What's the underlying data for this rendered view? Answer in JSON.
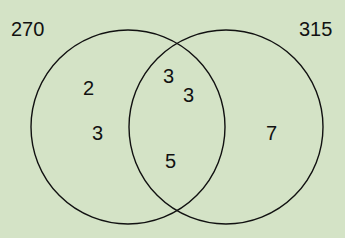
{
  "diagram": {
    "type": "venn",
    "background": "#d4e3c6",
    "sets": [
      {
        "label": "270",
        "cx": 128,
        "cy": 127,
        "r": 97
      },
      {
        "label": "315",
        "cx": 226,
        "cy": 127,
        "r": 97
      }
    ],
    "regions": {
      "left_only": [
        "2",
        "3"
      ],
      "intersection": [
        "3",
        "3",
        "5"
      ],
      "right_only": [
        "7"
      ]
    }
  }
}
